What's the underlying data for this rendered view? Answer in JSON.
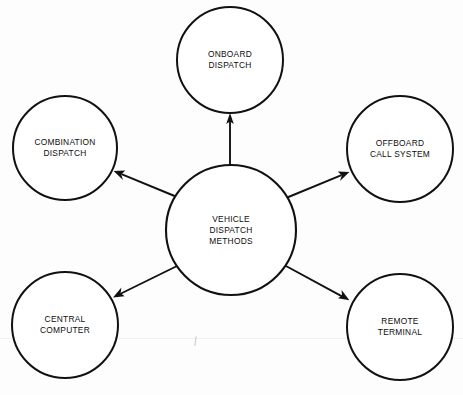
{
  "diagram": {
    "title": "Vehicle Dispatch Methods",
    "type": "radial-hub-and-spoke",
    "background_color": "#fdfdfd",
    "stroke_color": "#111111",
    "text_color": "#0d0d0d",
    "center": {
      "id": "vehicle-dispatch-methods",
      "label": "VEHICLE\nDISPATCH\nMETHODS",
      "cx": 231,
      "cy": 230,
      "r": 65,
      "stroke_width": 2.1
    },
    "nodes": [
      {
        "id": "onboard-dispatch",
        "label": "ONBOARD\nDISPATCH",
        "cx": 230,
        "cy": 60,
        "r": 53,
        "stroke_width": 2.0,
        "direction": "top"
      },
      {
        "id": "combination-dispatch",
        "label": "COMBINATION\nDISPATCH",
        "cx": 65,
        "cy": 148,
        "r": 52,
        "stroke_width": 2.0,
        "direction": "upper-left"
      },
      {
        "id": "offboard-call-system",
        "label": "OFFBOARD\nCALL SYSTEM",
        "cx": 400,
        "cy": 149,
        "r": 53,
        "stroke_width": 2.0,
        "direction": "upper-right"
      },
      {
        "id": "central-computer",
        "label": "CENTRAL\nCOMPUTER",
        "cx": 65,
        "cy": 325,
        "r": 53,
        "stroke_width": 2.0,
        "direction": "lower-left"
      },
      {
        "id": "remote-terminal",
        "label": "REMOTE\nTERMINAL",
        "cx": 400,
        "cy": 327,
        "r": 53,
        "stroke_width": 2.0,
        "direction": "lower-right"
      }
    ],
    "connectors": [
      {
        "id": "connector-to-onboard-dispatch",
        "from": "vehicle-dispatch-methods",
        "to": "onboard-dispatch",
        "x1": 230,
        "y1": 166,
        "x2": 230,
        "y2": 115,
        "arrowhead": "end",
        "stroke_width": 1.9
      },
      {
        "id": "connector-to-combination-dispatch",
        "from": "vehicle-dispatch-methods",
        "to": "combination-dispatch",
        "x1": 177,
        "y1": 197,
        "x2": 114,
        "y2": 171,
        "arrowhead": "end",
        "stroke_width": 1.9
      },
      {
        "id": "connector-to-offboard-call-system",
        "from": "vehicle-dispatch-methods",
        "to": "offboard-call-system",
        "x1": 286,
        "y1": 198,
        "x2": 349,
        "y2": 172,
        "arrowhead": "end",
        "stroke_width": 1.9
      },
      {
        "id": "connector-to-central-computer",
        "from": "vehicle-dispatch-methods",
        "to": "central-computer",
        "x1": 177,
        "y1": 266,
        "x2": 113,
        "y2": 297,
        "arrowhead": "end",
        "stroke_width": 1.9
      },
      {
        "id": "connector-to-remote-terminal",
        "from": "vehicle-dispatch-methods",
        "to": "remote-terminal",
        "x1": 286,
        "y1": 266,
        "x2": 349,
        "y2": 300,
        "arrowhead": "end",
        "stroke_width": 1.9
      }
    ]
  }
}
